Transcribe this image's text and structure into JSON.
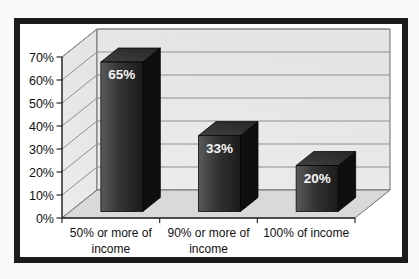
{
  "page": {
    "background": "#f9f9f9"
  },
  "frame": {
    "border_color": "#1c1c1c",
    "fill": "#ffffff"
  },
  "chart_data": {
    "type": "bar",
    "style": "3d-column",
    "title": "",
    "xlabel": "",
    "ylabel": "",
    "categories": [
      "50% or more of income",
      "90% or more of income",
      "100% of income"
    ],
    "category_label_lines": [
      [
        "50% or more of",
        "income"
      ],
      [
        "90% or more of",
        "income"
      ],
      [
        "100% of income"
      ]
    ],
    "values": [
      65,
      33,
      20
    ],
    "data_labels": [
      "65%",
      "33%",
      "20%"
    ],
    "y_ticks": [
      "0%",
      "10%",
      "20%",
      "30%",
      "40%",
      "50%",
      "60%",
      "70%"
    ],
    "y_tick_values": [
      0,
      10,
      20,
      30,
      40,
      50,
      60,
      70
    ],
    "ylim": [
      0,
      70
    ],
    "grid": true,
    "legend": false,
    "colors": {
      "bar_front_light": "#5a5a5a",
      "bar_front_mid": "#333333",
      "bar_front_dark": "#1b1b1b",
      "bar_top_light": "#404040",
      "bar_top_dark": "#262626",
      "bar_side": "#0f0f0f",
      "bar_outline": "#000000",
      "wall_fill": "#e4e4e4",
      "wall_fill_light": "#ececec",
      "floor_fill": "#d9d9d9",
      "gridline": "#8f8f8f",
      "wall_edge": "#6f6f6f",
      "axis": "#2a2a2a",
      "tick_label": "#111111",
      "data_label": "#f4f4f4"
    }
  }
}
